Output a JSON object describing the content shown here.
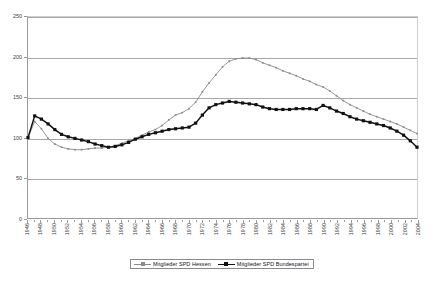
{
  "chart_data": {
    "type": "line",
    "title": "",
    "subtitle": "",
    "xlabel": "",
    "ylabel": "",
    "ylim": [
      0,
      250
    ],
    "ytick_values": [
      0,
      50,
      100,
      150,
      200,
      250
    ],
    "ytick_labels": [
      "0",
      "50",
      "100",
      "150",
      "200",
      "250"
    ],
    "grid": true,
    "legend_position": "bottom-center",
    "x": [
      1946,
      1947,
      1948,
      1949,
      1950,
      1951,
      1952,
      1953,
      1954,
      1955,
      1956,
      1957,
      1958,
      1959,
      1960,
      1961,
      1962,
      1963,
      1964,
      1965,
      1966,
      1967,
      1968,
      1969,
      1970,
      1971,
      1972,
      1973,
      1974,
      1975,
      1976,
      1977,
      1978,
      1979,
      1980,
      1981,
      1982,
      1983,
      1984,
      1985,
      1986,
      1987,
      1988,
      1989,
      1990,
      1991,
      1992,
      1993,
      1994,
      1995,
      1996,
      1997,
      1998,
      1999,
      2000,
      2001,
      2002,
      2003,
      2004
    ],
    "xtick_labels": [
      "1946",
      "1948",
      "1950",
      "1952",
      "1954",
      "1956",
      "1958",
      "1960",
      "1962",
      "1964",
      "1966",
      "1968",
      "1970",
      "1972",
      "1974",
      "1976",
      "1978",
      "1980",
      "1982",
      "1984",
      "1986",
      "1988",
      "1990",
      "1992",
      "1994",
      "1996",
      "1998",
      "2000",
      "2002",
      "2004"
    ],
    "xtick_years": [
      1946,
      1948,
      1950,
      1952,
      1954,
      1956,
      1958,
      1960,
      1962,
      1964,
      1966,
      1968,
      1970,
      1972,
      1974,
      1976,
      1978,
      1980,
      1982,
      1984,
      1986,
      1988,
      1990,
      1992,
      1994,
      1996,
      1998,
      2000,
      2002,
      2004
    ],
    "series": [
      {
        "name": "Mitglieder SPD Hessen",
        "color": "#8a8a8a",
        "marker": "small-dot",
        "values": [
          100,
          120,
          111,
          99,
          92,
          88,
          86,
          85,
          85,
          86,
          87,
          87,
          88,
          90,
          93,
          96,
          99,
          103,
          107,
          110,
          115,
          122,
          128,
          131,
          136,
          144,
          157,
          168,
          178,
          188,
          195,
          198,
          199,
          199,
          197,
          193,
          190,
          187,
          183,
          180,
          177,
          173,
          170,
          166,
          163,
          158,
          152,
          146,
          141,
          137,
          133,
          129,
          126,
          123,
          120,
          117,
          113,
          109,
          105
        ]
      },
      {
        "name": "Mitglieder SPD Bundespartei",
        "color": "#111111",
        "marker": "square",
        "values": [
          100,
          127,
          123,
          117,
          110,
          104,
          101,
          99,
          97,
          95,
          92,
          90,
          88,
          89,
          91,
          94,
          98,
          101,
          104,
          106,
          108,
          110,
          111,
          112,
          113,
          118,
          128,
          137,
          141,
          143,
          145,
          144,
          143,
          142,
          141,
          138,
          136,
          135,
          135,
          135,
          136,
          136,
          136,
          135,
          140,
          137,
          133,
          130,
          126,
          123,
          121,
          119,
          117,
          115,
          112,
          108,
          103,
          96,
          88
        ]
      }
    ]
  },
  "legend": {
    "items": [
      {
        "label": "Mitglieder SPD Hessen"
      },
      {
        "label": "Mitglieder SPD Bundespartei"
      }
    ]
  }
}
